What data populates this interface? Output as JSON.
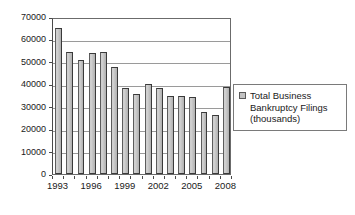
{
  "chart_data": {
    "type": "bar",
    "title": "",
    "xlabel": "",
    "ylabel": "",
    "ylim": [
      0,
      70000
    ],
    "grid": true,
    "legend_position": "right",
    "categories": [
      "1993",
      "1994",
      "1995",
      "1996",
      "1997",
      "1998",
      "1999",
      "2000",
      "2001",
      "2002",
      "2003",
      "2004",
      "2005",
      "2006",
      "2007",
      "2008"
    ],
    "values": [
      65000,
      54500,
      51000,
      53800,
      54500,
      47500,
      38500,
      35500,
      40000,
      38500,
      35000,
      34800,
      34500,
      27800,
      26500,
      39000
    ],
    "series": [
      {
        "name": "Total Business Bankruptcy Filings (thousands)",
        "values": [
          65000,
          54500,
          51000,
          53800,
          54500,
          47500,
          38500,
          35500,
          40000,
          38500,
          35000,
          34800,
          34500,
          27800,
          26500,
          39000
        ]
      }
    ],
    "y_ticks": [
      0,
      10000,
      20000,
      30000,
      40000,
      50000,
      60000,
      70000
    ],
    "y_tick_labels": [
      "0",
      "10000",
      "20000",
      "30000",
      "40000",
      "50000",
      "60000",
      "70000"
    ],
    "x_tick_labels": [
      "1993",
      "1996",
      "1999",
      "2002",
      "2005",
      "2008"
    ],
    "x_tick_categories": [
      "1993",
      "1996",
      "1999",
      "2002",
      "2005",
      "2008"
    ],
    "legend": [
      {
        "label": "Total Business\nBankruptcy Filings\n(thousands)",
        "color": "#c2c2c2"
      }
    ]
  },
  "colors": {
    "bar_fill": "#c2c2c2",
    "bar_border": "#3a3a3a",
    "gridline": "#9a9a9a",
    "axis": "#4a4a4a",
    "text": "#1a1a1a",
    "background": "#ffffff"
  }
}
